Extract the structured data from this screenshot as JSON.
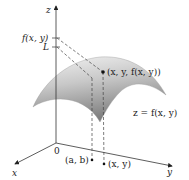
{
  "figure": {
    "axes": {
      "z_label": "z",
      "x_label": "x",
      "y_label": "y",
      "origin_label": "0"
    },
    "z_ticks": {
      "upper": "f(x, y)",
      "lower": "L"
    },
    "points": {
      "surface_point": "(x, y, f(x, y))",
      "domain_point_ab": "(a, b)",
      "domain_point_xy": "(x, y)"
    },
    "surface_label": "z = f(x, y)",
    "colors": {
      "axis": "#333333",
      "surface_light": "#f0f0f0",
      "surface_dark": "#8a8a8a",
      "dashed": "#444444"
    }
  }
}
